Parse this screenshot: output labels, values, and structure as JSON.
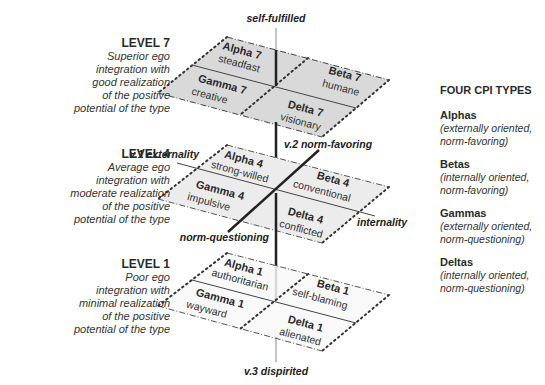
{
  "levels": [
    {
      "id": "level7",
      "title": "LEVEL 7",
      "lines": [
        "Superior ego",
        "integration with",
        "good realization",
        "of the positive",
        "potential of the type"
      ],
      "fill": "#d9d9d9"
    },
    {
      "id": "level4",
      "title": "LEVEL 4",
      "lines": [
        "Average ego",
        "integration with",
        "moderate realization",
        "of the positive",
        "potential of the type"
      ],
      "fill": "#ececec"
    },
    {
      "id": "level1",
      "title": "LEVEL 1",
      "lines": [
        "Poor ego",
        "integration with",
        "minimal realization",
        "of the positive",
        "potential of the type"
      ],
      "fill": "#f8f8f8"
    }
  ],
  "planes": {
    "level7": {
      "alpha": {
        "name": "Alpha 7",
        "trait": "steadfast"
      },
      "beta": {
        "name": "Beta 7",
        "trait": "humane"
      },
      "gamma": {
        "name": "Gamma 7",
        "trait": "creative"
      },
      "delta": {
        "name": "Delta 7",
        "trait": "visionary"
      }
    },
    "level4": {
      "alpha": {
        "name": "Alpha 4",
        "trait": "strong-willed"
      },
      "beta": {
        "name": "Beta 4",
        "trait": "conventional"
      },
      "gamma": {
        "name": "Gamma 4",
        "trait": "impulsive"
      },
      "delta": {
        "name": "Delta 4",
        "trait": "conflicted"
      }
    },
    "level1": {
      "alpha": {
        "name": "Alpha 1",
        "trait": "authoritarian"
      },
      "beta": {
        "name": "Beta 1",
        "trait": "self-blaming"
      },
      "gamma": {
        "name": "Gamma 1",
        "trait": "wayward"
      },
      "delta": {
        "name": "Delta 1",
        "trait": "alienated"
      }
    }
  },
  "axes": {
    "top": "self-fulfilled",
    "bottom": "v.3 dispirited",
    "v1_left": "v.1 externality",
    "v1_right": "internality",
    "v2_top": "v.2 norm-favoring",
    "v2_bottom": "norm-questioning"
  },
  "types_panel": {
    "title": "FOUR CPI TYPES",
    "items": [
      {
        "name": "Alphas",
        "desc": [
          "(externally oriented,",
          "norm-favoring)"
        ]
      },
      {
        "name": "Betas",
        "desc": [
          "(internally oriented,",
          "norm-favoring)"
        ]
      },
      {
        "name": "Gammas",
        "desc": [
          "(externally oriented,",
          "norm-questioning)"
        ]
      },
      {
        "name": "Deltas",
        "desc": [
          "(internally oriented,",
          "norm-questioning)"
        ]
      }
    ]
  }
}
